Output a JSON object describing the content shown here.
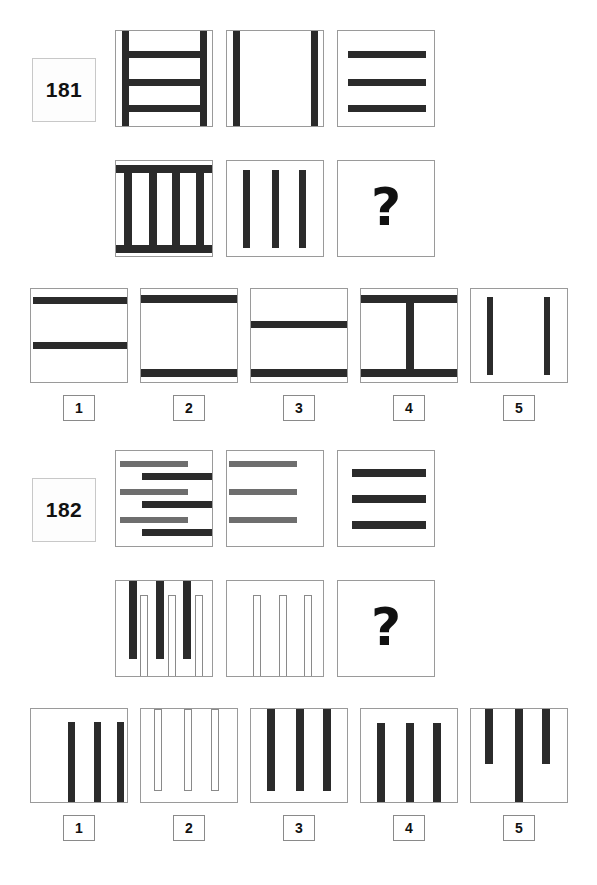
{
  "page": {
    "width": 597,
    "height": 885,
    "background": "#ffffff",
    "ink": "#2b2b2b",
    "gray_ink": "#6e6e6e",
    "border": "#9a9a9a"
  },
  "puzzles": [
    {
      "id": "181",
      "number_label": "181",
      "question_mark": "?",
      "matrix": {
        "rows": [
          {
            "cells": [
              {
                "name": "cell-r1c1",
                "description": "two vertical edge bars plus three horizontal bars",
                "bars": [
                  {
                    "orient": "v",
                    "x": 6,
                    "y": 0,
                    "w": 7,
                    "h": 97,
                    "fill": "black"
                  },
                  {
                    "orient": "v",
                    "x": 84,
                    "y": 0,
                    "w": 7,
                    "h": 97,
                    "fill": "black"
                  },
                  {
                    "orient": "h",
                    "x": 6,
                    "y": 20,
                    "w": 85,
                    "h": 7,
                    "fill": "black"
                  },
                  {
                    "orient": "h",
                    "x": 6,
                    "y": 48,
                    "w": 85,
                    "h": 7,
                    "fill": "black"
                  },
                  {
                    "orient": "h",
                    "x": 6,
                    "y": 74,
                    "w": 85,
                    "h": 7,
                    "fill": "black"
                  }
                ]
              },
              {
                "name": "cell-r1c2",
                "description": "two vertical edge bars only",
                "bars": [
                  {
                    "orient": "v",
                    "x": 6,
                    "y": 0,
                    "w": 7,
                    "h": 97,
                    "fill": "black"
                  },
                  {
                    "orient": "v",
                    "x": 84,
                    "y": 0,
                    "w": 7,
                    "h": 97,
                    "fill": "black"
                  }
                ]
              },
              {
                "name": "cell-r1c3",
                "description": "three horizontal bars only",
                "bars": [
                  {
                    "orient": "h",
                    "x": 10,
                    "y": 20,
                    "w": 78,
                    "h": 7,
                    "fill": "black"
                  },
                  {
                    "orient": "h",
                    "x": 10,
                    "y": 48,
                    "w": 78,
                    "h": 7,
                    "fill": "black"
                  },
                  {
                    "orient": "h",
                    "x": 10,
                    "y": 74,
                    "w": 78,
                    "h": 7,
                    "fill": "black"
                  }
                ]
              }
            ]
          },
          {
            "cells": [
              {
                "name": "cell-r2c1",
                "description": "top and bottom horizontal bars plus four vertical bars",
                "bars": [
                  {
                    "orient": "h",
                    "x": 0,
                    "y": 4,
                    "w": 98,
                    "h": 8,
                    "fill": "black"
                  },
                  {
                    "orient": "h",
                    "x": 0,
                    "y": 84,
                    "w": 98,
                    "h": 8,
                    "fill": "black"
                  },
                  {
                    "orient": "v",
                    "x": 8,
                    "y": 4,
                    "w": 8,
                    "h": 88,
                    "fill": "black"
                  },
                  {
                    "orient": "v",
                    "x": 33,
                    "y": 4,
                    "w": 8,
                    "h": 88,
                    "fill": "black"
                  },
                  {
                    "orient": "v",
                    "x": 56,
                    "y": 4,
                    "w": 8,
                    "h": 88,
                    "fill": "black"
                  },
                  {
                    "orient": "v",
                    "x": 80,
                    "y": 4,
                    "w": 8,
                    "h": 88,
                    "fill": "black"
                  }
                ]
              },
              {
                "name": "cell-r2c2",
                "description": "three vertical bars",
                "bars": [
                  {
                    "orient": "v",
                    "x": 16,
                    "y": 9,
                    "w": 7,
                    "h": 78,
                    "fill": "black"
                  },
                  {
                    "orient": "v",
                    "x": 45,
                    "y": 9,
                    "w": 7,
                    "h": 78,
                    "fill": "black"
                  },
                  {
                    "orient": "v",
                    "x": 72,
                    "y": 9,
                    "w": 7,
                    "h": 78,
                    "fill": "black"
                  }
                ]
              },
              {
                "name": "cell-r2c3-answer",
                "description": "unknown answer cell",
                "is_question": true,
                "bars": []
              }
            ]
          }
        ]
      },
      "options": [
        {
          "label": "1",
          "name": "option-1",
          "description": "horizontal bar near top and one in the middle",
          "bars": [
            {
              "orient": "h",
              "x": 2,
              "y": 8,
              "w": 94,
              "h": 7,
              "fill": "black"
            },
            {
              "orient": "h",
              "x": 2,
              "y": 53,
              "w": 94,
              "h": 7,
              "fill": "black"
            }
          ]
        },
        {
          "label": "2",
          "name": "option-2",
          "description": "horizontal bar at top and at bottom",
          "bars": [
            {
              "orient": "h",
              "x": 0,
              "y": 6,
              "w": 98,
              "h": 8,
              "fill": "black"
            },
            {
              "orient": "h",
              "x": 0,
              "y": 80,
              "w": 98,
              "h": 8,
              "fill": "black"
            }
          ]
        },
        {
          "label": "3",
          "name": "option-3",
          "description": "horizontal bar in the middle and at bottom",
          "bars": [
            {
              "orient": "h",
              "x": 0,
              "y": 32,
              "w": 98,
              "h": 7,
              "fill": "black"
            },
            {
              "orient": "h",
              "x": 0,
              "y": 80,
              "w": 98,
              "h": 8,
              "fill": "black"
            }
          ]
        },
        {
          "label": "4",
          "name": "option-4",
          "description": "top and bottom horizontal bars with a central vertical bar",
          "bars": [
            {
              "orient": "h",
              "x": 0,
              "y": 6,
              "w": 98,
              "h": 8,
              "fill": "black"
            },
            {
              "orient": "h",
              "x": 0,
              "y": 80,
              "w": 98,
              "h": 8,
              "fill": "black"
            },
            {
              "orient": "v",
              "x": 45,
              "y": 6,
              "w": 8,
              "h": 82,
              "fill": "black"
            }
          ]
        },
        {
          "label": "5",
          "name": "option-5",
          "description": "two vertical bars",
          "bars": [
            {
              "orient": "v",
              "x": 16,
              "y": 8,
              "w": 6,
              "h": 78,
              "fill": "black"
            },
            {
              "orient": "v",
              "x": 73,
              "y": 8,
              "w": 6,
              "h": 78,
              "fill": "black"
            }
          ]
        }
      ]
    },
    {
      "id": "182",
      "number_label": "182",
      "question_mark": "?",
      "matrix": {
        "rows": [
          {
            "cells": [
              {
                "name": "cell-r1c1",
                "description": "three gray left-aligned bars interleaved with three black right-aligned bars",
                "bars": [
                  {
                    "orient": "h",
                    "x": 4,
                    "y": 10,
                    "w": 68,
                    "h": 6,
                    "fill": "gray"
                  },
                  {
                    "orient": "h",
                    "x": 26,
                    "y": 22,
                    "w": 70,
                    "h": 7,
                    "fill": "black"
                  },
                  {
                    "orient": "h",
                    "x": 4,
                    "y": 38,
                    "w": 68,
                    "h": 6,
                    "fill": "gray"
                  },
                  {
                    "orient": "h",
                    "x": 26,
                    "y": 50,
                    "w": 70,
                    "h": 7,
                    "fill": "black"
                  },
                  {
                    "orient": "h",
                    "x": 4,
                    "y": 66,
                    "w": 68,
                    "h": 6,
                    "fill": "gray"
                  },
                  {
                    "orient": "h",
                    "x": 26,
                    "y": 78,
                    "w": 70,
                    "h": 7,
                    "fill": "black"
                  }
                ]
              },
              {
                "name": "cell-r1c2",
                "description": "three gray left-aligned bars",
                "bars": [
                  {
                    "orient": "h",
                    "x": 2,
                    "y": 10,
                    "w": 68,
                    "h": 6,
                    "fill": "gray"
                  },
                  {
                    "orient": "h",
                    "x": 2,
                    "y": 38,
                    "w": 68,
                    "h": 6,
                    "fill": "gray"
                  },
                  {
                    "orient": "h",
                    "x": 2,
                    "y": 66,
                    "w": 68,
                    "h": 6,
                    "fill": "gray"
                  }
                ]
              },
              {
                "name": "cell-r1c3",
                "description": "three black right-aligned bars",
                "bars": [
                  {
                    "orient": "h",
                    "x": 14,
                    "y": 18,
                    "w": 74,
                    "h": 8,
                    "fill": "black"
                  },
                  {
                    "orient": "h",
                    "x": 14,
                    "y": 44,
                    "w": 74,
                    "h": 8,
                    "fill": "black"
                  },
                  {
                    "orient": "h",
                    "x": 14,
                    "y": 70,
                    "w": 74,
                    "h": 8,
                    "fill": "black"
                  }
                ]
              }
            ]
          },
          {
            "cells": [
              {
                "name": "cell-r2c1",
                "description": "three black bars hanging from the top interleaved with three hollow bars rising from the bottom",
                "bars": [
                  {
                    "orient": "v",
                    "x": 13,
                    "y": 0,
                    "w": 8,
                    "h": 78,
                    "fill": "black"
                  },
                  {
                    "orient": "v",
                    "x": 24,
                    "y": 14,
                    "w": 8,
                    "h": 83,
                    "fill": "hollow"
                  },
                  {
                    "orient": "v",
                    "x": 40,
                    "y": 0,
                    "w": 8,
                    "h": 78,
                    "fill": "black"
                  },
                  {
                    "orient": "v",
                    "x": 52,
                    "y": 14,
                    "w": 8,
                    "h": 83,
                    "fill": "hollow"
                  },
                  {
                    "orient": "v",
                    "x": 67,
                    "y": 0,
                    "w": 8,
                    "h": 78,
                    "fill": "black"
                  },
                  {
                    "orient": "v",
                    "x": 79,
                    "y": 14,
                    "w": 8,
                    "h": 83,
                    "fill": "hollow"
                  }
                ]
              },
              {
                "name": "cell-r2c2",
                "description": "three hollow outlined bars rising from the bottom",
                "bars": [
                  {
                    "orient": "v",
                    "x": 26,
                    "y": 14,
                    "w": 8,
                    "h": 83,
                    "fill": "hollow"
                  },
                  {
                    "orient": "v",
                    "x": 52,
                    "y": 14,
                    "w": 8,
                    "h": 83,
                    "fill": "hollow"
                  },
                  {
                    "orient": "v",
                    "x": 77,
                    "y": 14,
                    "w": 8,
                    "h": 83,
                    "fill": "hollow"
                  }
                ]
              },
              {
                "name": "cell-r2c3-answer",
                "description": "unknown answer cell",
                "is_question": true,
                "bars": []
              }
            ]
          }
        ]
      },
      "options": [
        {
          "label": "1",
          "name": "option-1",
          "description": "three black bars shifted to the right side",
          "bars": [
            {
              "orient": "v",
              "x": 37,
              "y": 13,
              "w": 7,
              "h": 82,
              "fill": "black"
            },
            {
              "orient": "v",
              "x": 63,
              "y": 13,
              "w": 7,
              "h": 82,
              "fill": "black"
            },
            {
              "orient": "v",
              "x": 86,
              "y": 13,
              "w": 7,
              "h": 82,
              "fill": "black"
            }
          ]
        },
        {
          "label": "2",
          "name": "option-2",
          "description": "three hollow outlined bars hanging from the top",
          "bars": [
            {
              "orient": "v",
              "x": 13,
              "y": 0,
              "w": 8,
              "h": 82,
              "fill": "hollow"
            },
            {
              "orient": "v",
              "x": 43,
              "y": 0,
              "w": 8,
              "h": 82,
              "fill": "hollow"
            },
            {
              "orient": "v",
              "x": 70,
              "y": 0,
              "w": 8,
              "h": 82,
              "fill": "hollow"
            }
          ]
        },
        {
          "label": "3",
          "name": "option-3",
          "description": "three black bars hanging from the top",
          "bars": [
            {
              "orient": "v",
              "x": 16,
              "y": 0,
              "w": 8,
              "h": 82,
              "fill": "black"
            },
            {
              "orient": "v",
              "x": 45,
              "y": 0,
              "w": 8,
              "h": 82,
              "fill": "black"
            },
            {
              "orient": "v",
              "x": 72,
              "y": 0,
              "w": 8,
              "h": 82,
              "fill": "black"
            }
          ]
        },
        {
          "label": "4",
          "name": "option-4",
          "description": "three black bars rising from the bottom",
          "bars": [
            {
              "orient": "v",
              "x": 16,
              "y": 14,
              "w": 8,
              "h": 83,
              "fill": "black"
            },
            {
              "orient": "v",
              "x": 45,
              "y": 14,
              "w": 8,
              "h": 83,
              "fill": "black"
            },
            {
              "orient": "v",
              "x": 72,
              "y": 14,
              "w": 8,
              "h": 83,
              "fill": "black"
            }
          ]
        },
        {
          "label": "5",
          "name": "option-5",
          "description": "three black bars from the top with the middle one reaching the bottom",
          "bars": [
            {
              "orient": "v",
              "x": 14,
              "y": 0,
              "w": 8,
              "h": 55,
              "fill": "black"
            },
            {
              "orient": "v",
              "x": 44,
              "y": 0,
              "w": 8,
              "h": 95,
              "fill": "black"
            },
            {
              "orient": "v",
              "x": 71,
              "y": 0,
              "w": 8,
              "h": 55,
              "fill": "black"
            }
          ]
        }
      ]
    }
  ],
  "layout": {
    "matrix_col_x": [
      115,
      226,
      337
    ],
    "matrix_row_y": [
      0,
      130
    ],
    "option_col_x": [
      30,
      140,
      250,
      360,
      470
    ],
    "option_y": 258,
    "option_label_y": 365,
    "badge_x": 32,
    "badge_y": 28
  }
}
